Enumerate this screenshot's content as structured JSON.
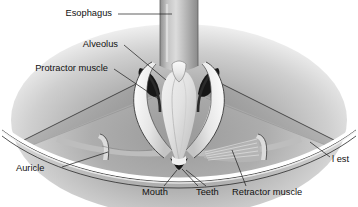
{
  "figure": {
    "style": "grayscale airbrush anatomical illustration",
    "background_color": "#ffffff",
    "ink_color": "#1a1a1a"
  },
  "labels": [
    {
      "id": "esophagus",
      "text": "Esophagus",
      "x": 112,
      "y": 14,
      "anchor": "end"
    },
    {
      "id": "alveolus",
      "text": "Alveolus",
      "x": 118,
      "y": 45,
      "anchor": "end"
    },
    {
      "id": "protractor-muscle",
      "text": "Protractor muscle",
      "x": 108,
      "y": 69,
      "anchor": "end"
    },
    {
      "id": "auricle",
      "text": "Auricle",
      "x": 16,
      "y": 169,
      "anchor": "start"
    },
    {
      "id": "mouth",
      "text": "Mouth",
      "x": 142,
      "y": 193,
      "anchor": "start"
    },
    {
      "id": "teeth",
      "text": "Teeth",
      "x": 196,
      "y": 193,
      "anchor": "start"
    },
    {
      "id": "retractor-muscle",
      "text": "Retractor muscle",
      "x": 232,
      "y": 193,
      "anchor": "start"
    },
    {
      "id": "mantle-crest",
      "text": "l est",
      "x": 332,
      "y": 160,
      "anchor": "start"
    }
  ],
  "structures": [
    {
      "id": "esophagus-tube",
      "name": "esophagus tube"
    },
    {
      "id": "alveolus-left",
      "name": "left alveolus"
    },
    {
      "id": "alveolus-right",
      "name": "right alveolus"
    },
    {
      "id": "buccal-mass",
      "name": "central buccal mass"
    },
    {
      "id": "protractor-band",
      "name": "protractor muscle band"
    },
    {
      "id": "retractor-fibers",
      "name": "retractor muscle fibers"
    },
    {
      "id": "auricle-wing",
      "name": "auricle / mantle wing"
    },
    {
      "id": "mantle-margin",
      "name": "mantle margin arc"
    },
    {
      "id": "mouth-aperture",
      "name": "mouth aperture"
    }
  ]
}
